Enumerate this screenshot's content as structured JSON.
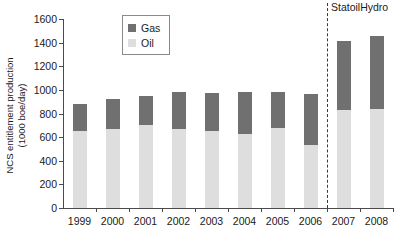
{
  "chart_data": {
    "type": "bar",
    "subtype": "stacked-vertical",
    "title": "",
    "xlabel": "",
    "ylabel": "NCS entitlement production (1000 boe/day)",
    "ylabel_line1": "NCS entitlement production",
    "ylabel_line2": "(1000 boe/day)",
    "categories": [
      "1999",
      "2000",
      "2001",
      "2002",
      "2003",
      "2004",
      "2005",
      "2006",
      "2007",
      "2008"
    ],
    "series": [
      {
        "name": "Oil",
        "color": "#dedede",
        "values": [
          650,
          670,
          700,
          665,
          650,
          625,
          680,
          535,
          830,
          840
        ]
      },
      {
        "name": "Gas",
        "color": "#707070",
        "values": [
          230,
          255,
          245,
          320,
          325,
          355,
          305,
          430,
          580,
          620
        ]
      }
    ],
    "totals": [
      880,
      925,
      945,
      985,
      975,
      980,
      985,
      965,
      1410,
      1460
    ],
    "ylim": [
      0,
      1600
    ],
    "yticks": [
      0,
      200,
      400,
      600,
      800,
      1000,
      1200,
      1400,
      1600
    ],
    "ytick_labels": [
      "0",
      "200",
      "400",
      "600",
      "800",
      "1000",
      "1200",
      "1400",
      "1600"
    ],
    "grid": false,
    "legend_position": "upper-left-inside",
    "legend_entries": [
      "Gas",
      "Oil"
    ],
    "annotations": [
      {
        "text": "StatoilHydro",
        "after_category": "2006",
        "divider": "dashed-vertical"
      }
    ]
  },
  "legend": {
    "entries": [
      {
        "label": "Gas",
        "color": "#707070"
      },
      {
        "label": "Oil",
        "color": "#dedede"
      }
    ]
  },
  "annotation": {
    "label": "StatoilHydro"
  }
}
